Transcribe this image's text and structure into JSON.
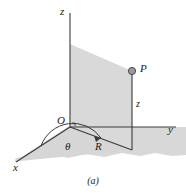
{
  "figure": {
    "caption": "(a)",
    "axes": {
      "z_label": "z",
      "y_label": "y",
      "x_label": "x"
    },
    "labels": {
      "origin": "O",
      "point": "P",
      "theta": "θ",
      "radius": "R",
      "height": "z"
    },
    "colors": {
      "plane_fill": "#d9d9d9",
      "plane_fill_ground": "#d6d6d6",
      "line": "#3a3a3a",
      "point_fill": "#9a9a9a",
      "point_stroke": "#4a4a4a",
      "background": "#ffffff",
      "text": "#1a1a1a"
    }
  }
}
